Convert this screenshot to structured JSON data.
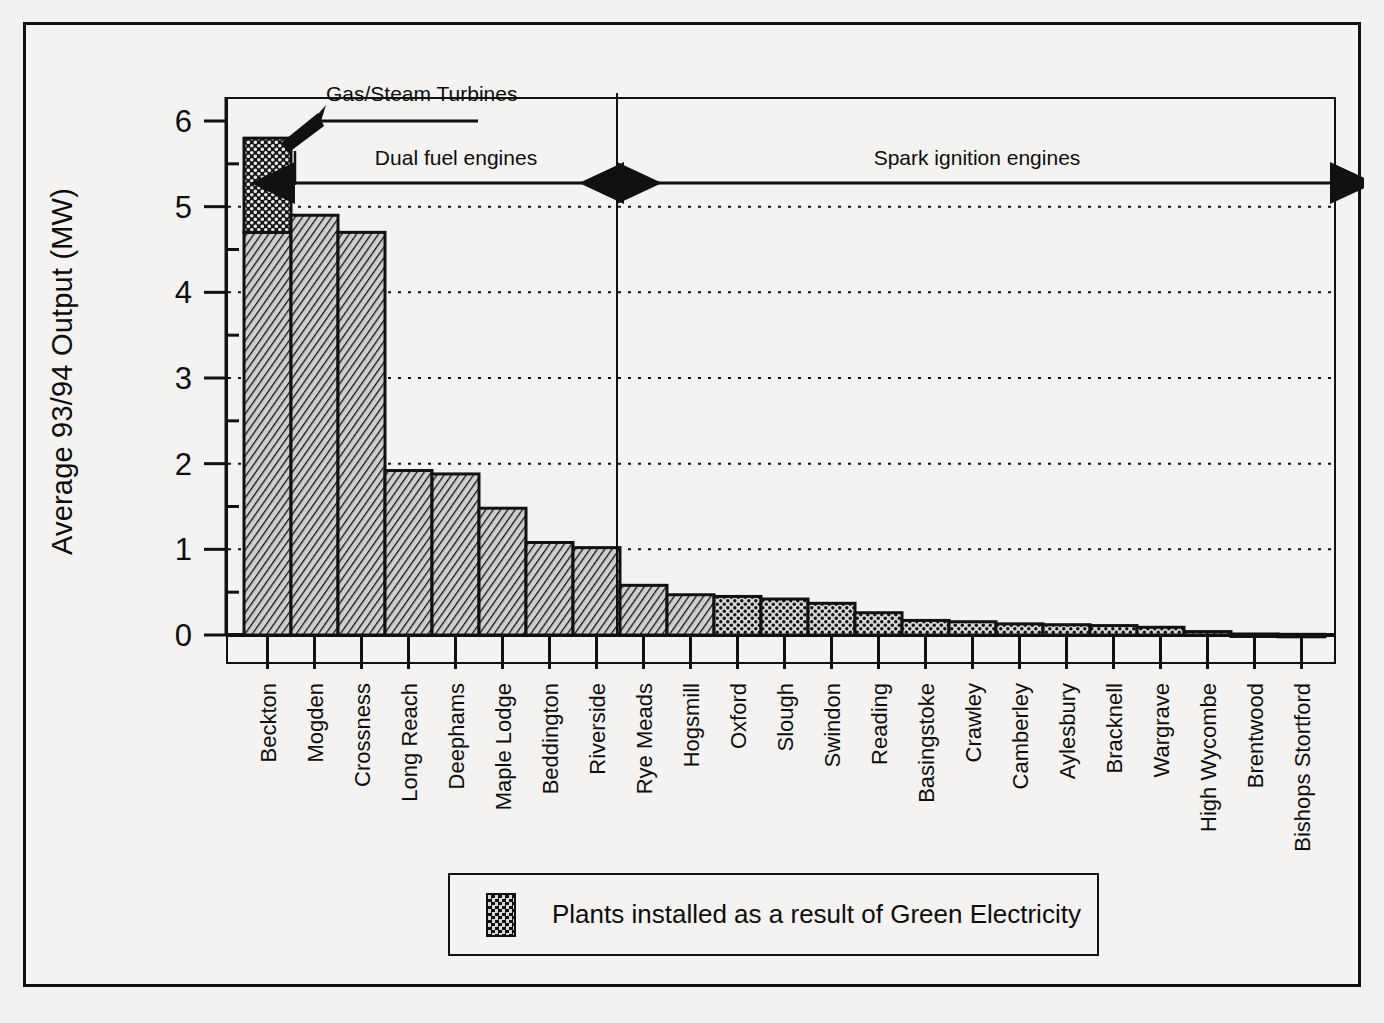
{
  "chart_data": {
    "type": "bar",
    "title": "",
    "xlabel": "",
    "ylabel": "Average 93/94 Output (MW)",
    "ylim": [
      0,
      6.35
    ],
    "yticks": [
      0,
      1,
      2,
      3,
      4,
      5,
      6
    ],
    "ytick_labels": [
      "0",
      "1",
      "2",
      "3",
      "4",
      "5",
      "6"
    ],
    "minor_yticks": [
      0.5,
      1.5,
      2.5,
      3.5,
      4.5,
      5.5
    ],
    "grid": "horizontal dotted gridlines at 1,2,3,4,5",
    "legend_position": "below plot, centred",
    "categories": [
      "Beckton",
      "Mogden",
      "Crossness",
      "Long Reach",
      "Deephams",
      "Maple Lodge",
      "Beddington",
      "Riverside",
      "Rye Meads",
      "Hogsmill",
      "Oxford",
      "Slough",
      "Swindon",
      "Reading",
      "Basingstoke",
      "Crawley",
      "Camberley",
      "Aylesbury",
      "Bracknell",
      "Wargrave",
      "High Wycombe",
      "Brentwood",
      "Bishops Stortford"
    ],
    "series": [
      {
        "name": "Existing plant",
        "pattern": "diagonal-hatch",
        "values": [
          4.7,
          4.9,
          4.7,
          1.92,
          1.88,
          1.48,
          1.08,
          1.02,
          0.58,
          0.47,
          0,
          0,
          0,
          0,
          0,
          0,
          0,
          0,
          0,
          0,
          0,
          0,
          0
        ]
      },
      {
        "name": "Plants installed as a result of Green Electricity",
        "pattern": "stipple",
        "values": [
          1.1,
          0,
          0,
          0,
          0,
          0,
          0,
          0,
          0,
          0,
          0.45,
          0.42,
          0.37,
          0.26,
          0.17,
          0.155,
          0.13,
          0.12,
          0.11,
          0.09,
          0.04,
          0.012,
          0.008
        ]
      }
    ],
    "totals": [
      5.8,
      4.9,
      4.7,
      1.92,
      1.88,
      1.48,
      1.08,
      1.02,
      0.58,
      0.47,
      0.45,
      0.42,
      0.37,
      0.26,
      0.17,
      0.155,
      0.13,
      0.12,
      0.11,
      0.09,
      0.04,
      0.012,
      0.008
    ],
    "annotations": [
      {
        "text": "Gas/Steam Turbines",
        "type": "pointer-arrow",
        "target": "Beckton"
      },
      {
        "text": "Dual fuel engines",
        "type": "double-headed-span",
        "from": "Beckton",
        "to": "Riverside"
      },
      {
        "text": "Spark ignition engines",
        "type": "double-headed-span",
        "from": "Rye Meads",
        "to": "Bishops Stortford"
      }
    ],
    "legend_entries": [
      {
        "label": "Plants installed as a result of Green Electricity",
        "pattern": "stipple"
      }
    ],
    "colors": {
      "ink": "#111111",
      "paper": "#f2f1ef",
      "hatch_fill": "#b4b4b4",
      "stipple_fill": "#8c8c8c",
      "dark_fill": "#1a1a1a"
    }
  }
}
